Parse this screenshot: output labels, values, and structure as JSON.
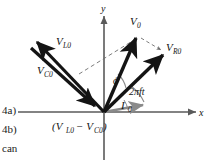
{
  "figure": {
    "type": "phasor-diagram",
    "axes": {
      "x_label": "x",
      "y_label": "y",
      "origin": [
        104,
        112
      ]
    },
    "vectors": [
      {
        "name": "V_0",
        "base_label": "V",
        "sub_label": "0",
        "label_x": 136,
        "label_y": 24,
        "tip": [
          138,
          36
        ],
        "style": "solid-thick",
        "note": "resultant voltage phasor, points up and to the right"
      },
      {
        "name": "V_R0",
        "base_label": "V",
        "sub_label": "R0",
        "label_x": 170,
        "label_y": 48,
        "tip": [
          165,
          53
        ],
        "style": "solid-thick",
        "note": "resistor voltage phasor, along the current direction"
      },
      {
        "name": "V_L0",
        "base_label": "V",
        "sub_label": "L0",
        "label_x": 58,
        "label_y": 45,
        "tip": [
          34,
          40
        ],
        "style": "solid-thick",
        "note": "inductor voltage phasor, points up and to the left"
      },
      {
        "name": "V_C0",
        "base_label": "V",
        "sub_label": "C0",
        "label_x": 41,
        "label_y": 74,
        "tip": [
          92,
          103
        ],
        "style": "solid-thick",
        "note": "capacitor voltage phasor, points down and to the right toward origin"
      },
      {
        "name": "I_0",
        "base_label": "I",
        "sub_label": "0",
        "label_x": 126,
        "label_y": 107,
        "tip": [
          146,
          104
        ],
        "style": "solid-gray",
        "note": "current phasor, small arrow just above x axis"
      }
    ],
    "difference_label": {
      "text": "(V",
      "sub1": "L0",
      "minus": "− V",
      "sub2": "C0",
      "close": ")",
      "x": 55,
      "y": 128,
      "full": "(V_L0 - V_C0)"
    },
    "angles": [
      {
        "name": "phi",
        "symbol": "ϕ",
        "label_x": 118,
        "label_y": 81,
        "note": "phase angle between V_0 and I_0"
      },
      {
        "name": "omega-t",
        "symbol": "2πft",
        "label_x": 135,
        "label_y": 92,
        "note": "rotation angle of the phasor diagram"
      }
    ],
    "dashed_lines": [
      {
        "name": "construction-line-left",
        "from": [
          78,
          73
        ],
        "to": [
          138,
          36
        ]
      },
      {
        "name": "construction-line-right",
        "from": [
          138,
          36
        ],
        "to": [
          165,
          53
        ]
      }
    ],
    "colors": {
      "ink": "#141414",
      "axis": "#5a5a5a",
      "current_gray": "#8a8a8a",
      "dashed": "#6e6e6e",
      "background": "#ffffff"
    }
  },
  "margin_notes": [
    {
      "name": "equation-number-4a",
      "text": "4a)"
    },
    {
      "name": "equation-number-4b",
      "text": "4b)"
    },
    {
      "name": "body-text-fragment",
      "text": "can"
    }
  ]
}
